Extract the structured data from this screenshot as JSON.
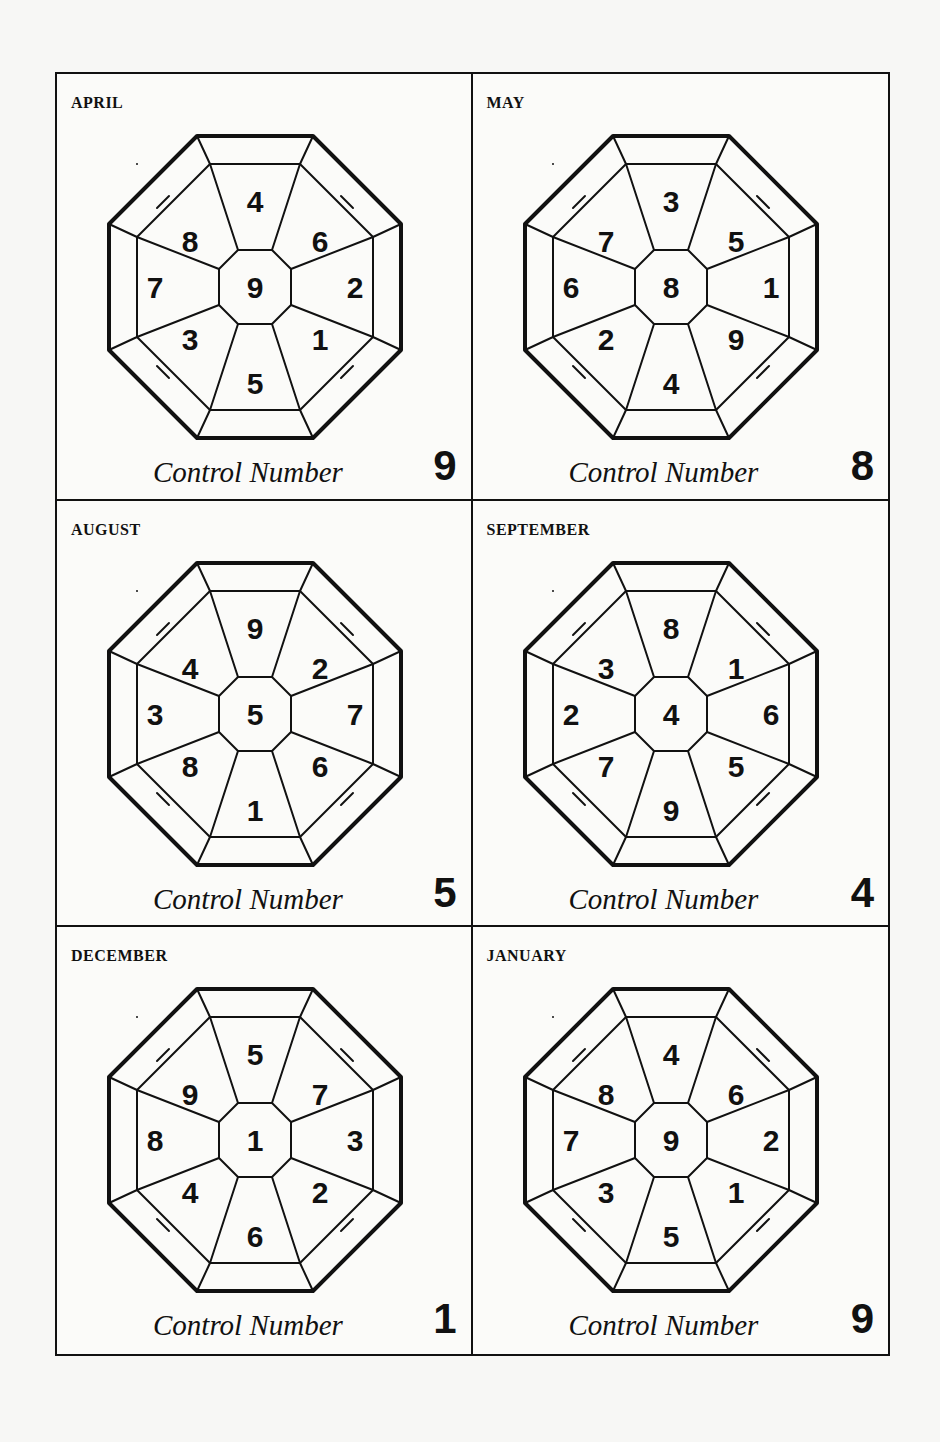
{
  "control_label": "Control Number",
  "panels": [
    {
      "month": "APRIL",
      "control": "9",
      "cells": {
        "n": "4",
        "ne": "6",
        "e": "2",
        "se": "1",
        "s": "5",
        "sw": "3",
        "w": "7",
        "nw": "8",
        "c": "9"
      }
    },
    {
      "month": "MAY",
      "control": "8",
      "cells": {
        "n": "3",
        "ne": "5",
        "e": "1",
        "se": "9",
        "s": "4",
        "sw": "2",
        "w": "6",
        "nw": "7",
        "c": "8"
      }
    },
    {
      "month": "AUGUST",
      "control": "5",
      "cells": {
        "n": "9",
        "ne": "2",
        "e": "7",
        "se": "6",
        "s": "1",
        "sw": "8",
        "w": "3",
        "nw": "4",
        "c": "5"
      }
    },
    {
      "month": "SEPTEMBER",
      "control": "4",
      "cells": {
        "n": "8",
        "ne": "1",
        "e": "6",
        "se": "5",
        "s": "9",
        "sw": "7",
        "w": "2",
        "nw": "3",
        "c": "4"
      }
    },
    {
      "month": "DECEMBER",
      "control": "1",
      "cells": {
        "n": "5",
        "ne": "7",
        "e": "3",
        "se": "2",
        "s": "6",
        "sw": "4",
        "w": "8",
        "nw": "9",
        "c": "1"
      }
    },
    {
      "month": "JANUARY",
      "control": "9",
      "cells": {
        "n": "4",
        "ne": "6",
        "e": "2",
        "se": "1",
        "s": "5",
        "sw": "3",
        "w": "7",
        "nw": "8",
        "c": "9"
      }
    }
  ]
}
